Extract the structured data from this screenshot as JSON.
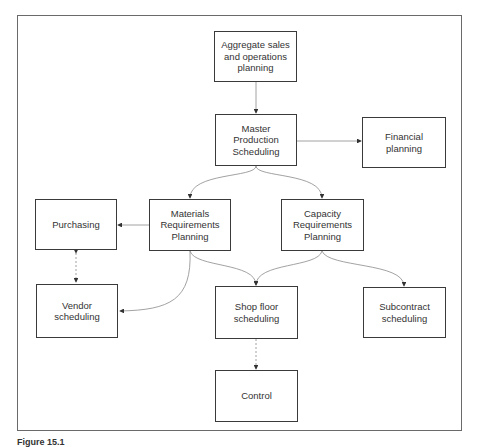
{
  "diagram": {
    "nodes": {
      "aggregate": {
        "label": "Aggregate sales\nand operations\nplanning"
      },
      "mps": {
        "label": "Master\nProduction\nScheduling"
      },
      "financial": {
        "label": "Financial\nplanning"
      },
      "purchasing": {
        "label": "Purchasing"
      },
      "mrp": {
        "label": "Materials\nRequirements\nPlanning"
      },
      "crp": {
        "label": "Capacity\nRequirements\nPlanning"
      },
      "vendor": {
        "label": "Vendor\nscheduling"
      },
      "shopfloor": {
        "label": "Shop floor\nscheduling"
      },
      "subcontract": {
        "label": "Subcontract\nscheduling"
      },
      "control": {
        "label": "Control"
      }
    },
    "edges": [
      {
        "from": "aggregate",
        "to": "mps"
      },
      {
        "from": "mps",
        "to": "financial"
      },
      {
        "from": "mps",
        "to": "mrp"
      },
      {
        "from": "mps",
        "to": "crp"
      },
      {
        "from": "mrp",
        "to": "purchasing"
      },
      {
        "from": "purchasing",
        "to": "vendor",
        "bidirectional": true
      },
      {
        "from": "mrp",
        "to": "vendor"
      },
      {
        "from": "mrp",
        "to": "shopfloor"
      },
      {
        "from": "crp",
        "to": "shopfloor"
      },
      {
        "from": "crp",
        "to": "subcontract"
      },
      {
        "from": "shopfloor",
        "to": "control"
      }
    ],
    "caption": "Figure 15.1"
  }
}
